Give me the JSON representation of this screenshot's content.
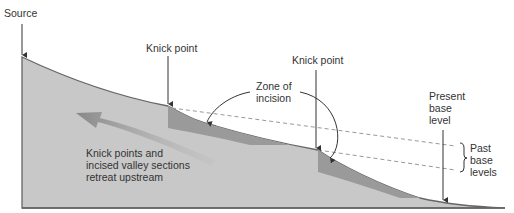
{
  "labels": {
    "source": "Source",
    "knick_point_1": "Knick point",
    "knick_point_2": "Knick point",
    "zone_line1": "Zone of",
    "zone_line2": "incision",
    "present_line1": "Present",
    "present_line2": "base",
    "present_line3": "level",
    "past_line1": "Past",
    "past_line2": "base",
    "past_line3": "levels",
    "retreat_line1": "Knick points and",
    "retreat_line2": "incised valley sections",
    "retreat_line3": "retreat upstream"
  },
  "colors": {
    "terrain": "#c8c8c8",
    "incised": "#9a9a9a",
    "outline": "#666666",
    "arrow": "#8a8a8a",
    "dashed": "#999999",
    "text": "#333333"
  }
}
